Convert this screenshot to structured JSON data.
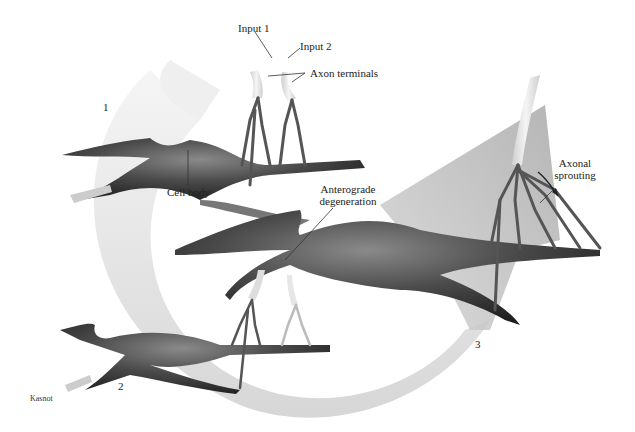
{
  "figure": {
    "labels": {
      "input1": "Input 1",
      "input2": "Input 2",
      "axon_terminals": "Axon terminals",
      "cell_body": "Cell body",
      "anterograde_line1": "Anterograde",
      "anterograde_line2": "degeneration",
      "axonal_line1": "Axonal",
      "axonal_line2": "sprouting"
    },
    "steps": [
      "1",
      "2",
      "3"
    ],
    "credit": "Kasnot",
    "colors": {
      "background": "#ffffff",
      "arrow_light": "#e8e8e8",
      "arrow_dark": "#b8b8b8",
      "neuron_dark": "#2a2a2a",
      "neuron_mid": "#777777",
      "axon_light": "#dddddd",
      "text": "#222222"
    }
  }
}
